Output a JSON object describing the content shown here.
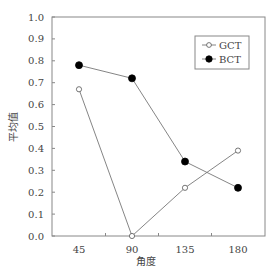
{
  "chart_data": {
    "type": "line",
    "title": "",
    "xlabel": "角度",
    "ylabel": "平均值",
    "categories": [
      "45",
      "90",
      "135",
      "180"
    ],
    "series": [
      {
        "name": "GCT",
        "marker": "open-circle",
        "values": [
          0.67,
          0.0,
          0.22,
          0.39
        ]
      },
      {
        "name": "BCT",
        "marker": "filled-circle",
        "values": [
          0.78,
          0.72,
          0.34,
          0.22
        ]
      }
    ],
    "ylim": [
      0.0,
      1.0
    ],
    "yticks": [
      "0.0",
      "0.1",
      "0.2",
      "0.3",
      "0.4",
      "0.5",
      "0.6",
      "0.7",
      "0.8",
      "0.9",
      "1.0"
    ],
    "grid": false,
    "legend_position": "upper right"
  },
  "colors": {
    "line": "#777777",
    "axis": "#888888",
    "marker_fill_bct": "#000000",
    "marker_fill_gct": "#ffffff"
  }
}
